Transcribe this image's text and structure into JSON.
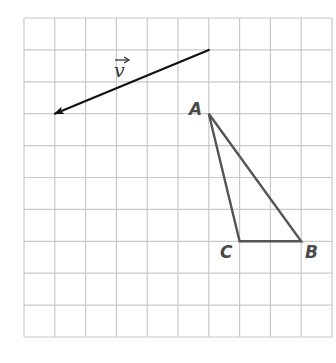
{
  "diagram": {
    "type": "coordinate-grid",
    "grid": {
      "columns": 10,
      "rows": 10,
      "origin_px": [
        24,
        18
      ],
      "cell_w_px": 30.8,
      "cell_h_px": 31.9,
      "line_color": "#c8c8c8"
    },
    "vector": {
      "label": "v",
      "tail": [
        6,
        1
      ],
      "head": [
        1,
        3
      ],
      "color": "#111111"
    },
    "triangle": {
      "color": "#555555",
      "vertices": [
        {
          "name": "A",
          "grid": [
            6,
            3
          ]
        },
        {
          "name": "B",
          "grid": [
            9,
            7
          ]
        },
        {
          "name": "C",
          "grid": [
            7,
            7
          ]
        }
      ]
    },
    "labels": {
      "A": "A",
      "B": "B",
      "C": "C",
      "v": "v"
    }
  }
}
